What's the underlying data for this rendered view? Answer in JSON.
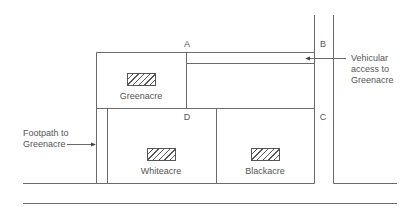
{
  "diagram": {
    "points": {
      "a": "A",
      "b": "B",
      "c": "C",
      "d": "D"
    },
    "plots": {
      "greenacre": "Greenacre",
      "whiteacre": "Whiteacre",
      "blackacre": "Blackacre"
    },
    "annotations": {
      "vehicular_line1": "Vehicular",
      "vehicular_line2": "access to",
      "vehicular_line3": "Greenacre",
      "footpath_line1": "Footpath to",
      "footpath_line2": "Greenacre"
    },
    "colors": {
      "line": "#555555",
      "text": "#555555",
      "background": "#ffffff"
    }
  }
}
